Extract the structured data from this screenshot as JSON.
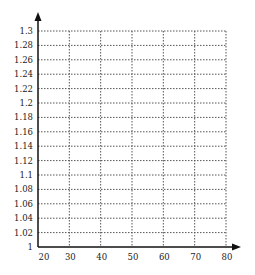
{
  "chart_data": {
    "type": "line",
    "title": "",
    "xlabel": "",
    "ylabel": "",
    "x_ticks": [
      20,
      30,
      40,
      50,
      60,
      70,
      80
    ],
    "y_ticks": [
      1,
      1.02,
      1.04,
      1.06,
      1.08,
      1.1,
      1.12,
      1.14,
      1.16,
      1.18,
      1.2,
      1.22,
      1.24,
      1.26,
      1.28,
      1.3
    ],
    "y_tick_labels": [
      "1",
      "1.02",
      "1.04",
      "1.06",
      "1.08",
      "1.1",
      "1.12",
      "1.14",
      "1.16",
      "1.18",
      "1.2",
      "1.22",
      "1.24",
      "1.26",
      "1.28",
      "1.3"
    ],
    "xlim": [
      20,
      80
    ],
    "ylim": [
      1,
      1.3
    ],
    "grid": true,
    "grid_style": "dotted",
    "series": [],
    "legend": null,
    "axis_arrows": true
  },
  "colors": {
    "axis": "#111111",
    "grid": "#555555",
    "text": "#222222"
  }
}
